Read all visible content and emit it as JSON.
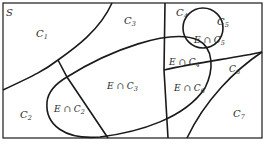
{
  "diagram": {
    "sample_space_label": "S",
    "partition_labels": [
      {
        "id": "C1",
        "main": "C",
        "sub": "1"
      },
      {
        "id": "C2",
        "main": "C",
        "sub": "2"
      },
      {
        "id": "C3",
        "main": "C",
        "sub": "3"
      },
      {
        "id": "C4",
        "main": "C",
        "sub": "4"
      },
      {
        "id": "C5",
        "main": "C",
        "sub": "5"
      },
      {
        "id": "C6",
        "main": "C",
        "sub": "6"
      },
      {
        "id": "C7",
        "main": "C",
        "sub": "7"
      }
    ],
    "intersection_labels": [
      {
        "id": "E_C2",
        "main": "E ∩ C",
        "sub": "2"
      },
      {
        "id": "E_C3",
        "main": "E ∩ C",
        "sub": "3"
      },
      {
        "id": "E_C4",
        "main": "E ∩ C",
        "sub": "4"
      },
      {
        "id": "E_C5",
        "main": "E ∩ C",
        "sub": "5"
      },
      {
        "id": "E_C6",
        "main": "E ∩ C",
        "sub": "6"
      }
    ],
    "colors": {
      "line": "#1a1a1a",
      "text": "#2a2a2a",
      "background": "#ffffff"
    }
  }
}
